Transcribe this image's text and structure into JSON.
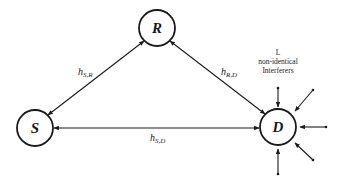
{
  "diagram": {
    "nodes": [
      {
        "id": "S",
        "label": "S",
        "cx": 35,
        "cy": 128,
        "r": 18
      },
      {
        "id": "R",
        "label": "R",
        "cx": 157,
        "cy": 28,
        "r": 18
      },
      {
        "id": "D",
        "label": "D",
        "cx": 278,
        "cy": 127,
        "r": 18
      }
    ],
    "edges": [
      {
        "from": "S",
        "to": "R",
        "label": "h",
        "sub": "S,R",
        "bidirectional": true
      },
      {
        "from": "R",
        "to": "D",
        "label": "h",
        "sub": "R,D",
        "bidirectional": true
      },
      {
        "from": "S",
        "to": "D",
        "label": "h",
        "sub": "S,D",
        "bidirectional": true
      }
    ],
    "interferers": {
      "line1": "L",
      "line2": "non-identical",
      "line3": "Interferers",
      "count_arrows": 5
    },
    "colors": {
      "stroke": "#1a1a1a",
      "background": "#ffffff"
    }
  }
}
